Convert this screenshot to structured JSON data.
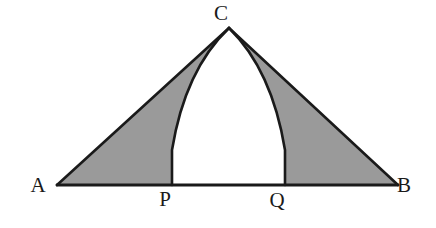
{
  "figure": {
    "background_color": "#ffffff",
    "stroke_color": "#1a1a1a",
    "shade_color": "#9a9a9a",
    "unshaded_color": "#ffffff",
    "stroke_width": 2.6,
    "points": {
      "A": {
        "label": "A",
        "x": 57,
        "y": 185,
        "label_x": 38,
        "label_y": 192
      },
      "B": {
        "label": "B",
        "x": 398,
        "y": 185,
        "label_x": 404,
        "label_y": 192
      },
      "C": {
        "label": "C",
        "x": 229,
        "y": 28,
        "label_x": 221,
        "label_y": 20
      },
      "P": {
        "label": "P",
        "x": 172,
        "y": 185,
        "label_x": 165,
        "label_y": 206
      },
      "Q": {
        "label": "Q",
        "x": 285,
        "y": 185,
        "label_x": 277,
        "label_y": 207
      }
    },
    "paths": {
      "left_shaded_region": "M 57 185 L 229 28 Q 185 70 172 150 L 172 185 Z",
      "right_shaded_region": "M 398 185 L 229 28 Q 272 70 285 150 L 285 185 Z",
      "center_region": "M 172 185 L 172 150 Q 185 70 229 28 Q 272 70 285 150 L 285 185 Z",
      "base_line": "M 57 185 L 398 185",
      "side_ac": "M 57 185 L 229 28",
      "side_bc": "M 398 185 L 229 28",
      "arc_cp": "M 229 28 Q 185 70 172 150 L 172 185",
      "arc_cq": "M 229 28 Q 272 70 285 150 L 285 185"
    }
  }
}
